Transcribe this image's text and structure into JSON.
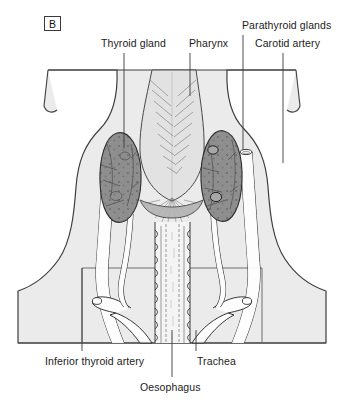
{
  "figure": {
    "panel_letter": "B",
    "caption_absent": true
  },
  "labels": {
    "thyroid_gland": "Thyroid gland",
    "pharynx": "Pharynx",
    "parathyroid_glands": "Parathyroid glands",
    "carotid_artery": "Carotid artery",
    "inferior_thyroid_artery": "Inferior thyroid artery",
    "trachea": "Trachea",
    "oesophagus": "Oesophagus"
  },
  "colors": {
    "background": "#ffffff",
    "body_fill": "#ebebeb",
    "body_outline": "#3d3d3d",
    "pharynx_fill": "#e2e2e2",
    "thyroid_fill": "#8e8e8e",
    "thyroid_outline": "#2e2e2e",
    "vessel_fill": "#fdfdfd",
    "vessel_outline": "#2b2b2b",
    "trachea_fill": "#f2f2f2",
    "leader_line": "#3a3a3a",
    "text": "#1b1b1b"
  },
  "structures": [
    {
      "name": "thyroid-gland-left-lobe",
      "kind": "gland"
    },
    {
      "name": "thyroid-gland-right-lobe",
      "kind": "gland"
    },
    {
      "name": "thyroid-isthmus",
      "kind": "gland"
    },
    {
      "name": "pharynx",
      "kind": "muscular-tube"
    },
    {
      "name": "parathyroid-gland-superior",
      "kind": "gland"
    },
    {
      "name": "parathyroid-gland-inferior",
      "kind": "gland"
    },
    {
      "name": "carotid-artery-left",
      "kind": "vessel"
    },
    {
      "name": "carotid-artery-right",
      "kind": "vessel"
    },
    {
      "name": "inferior-thyroid-artery-left",
      "kind": "vessel"
    },
    {
      "name": "inferior-thyroid-artery-right",
      "kind": "vessel"
    },
    {
      "name": "subclavian-artery-left",
      "kind": "vessel"
    },
    {
      "name": "subclavian-artery-right",
      "kind": "vessel"
    },
    {
      "name": "trachea",
      "kind": "airway"
    },
    {
      "name": "oesophagus",
      "kind": "tube"
    }
  ],
  "leaders": [
    {
      "name": "leader-thyroid-gland",
      "x1": 124,
      "y1": 53,
      "x2": 124,
      "y2": 148
    },
    {
      "name": "leader-pharynx",
      "x1": 190,
      "y1": 53,
      "x2": 190,
      "y2": 96
    },
    {
      "name": "leader-parathyroid-glands",
      "x1": 243,
      "y1": 35,
      "x2": 243,
      "y2": 150
    },
    {
      "name": "leader-carotid-artery",
      "x1": 283,
      "y1": 53,
      "x2": 283,
      "y2": 163
    },
    {
      "name": "leader-inferior-thyroid-artery",
      "x1": 82,
      "y1": 351,
      "x2": 82,
      "y2": 268
    },
    {
      "name": "leader-trachea",
      "x1": 196,
      "y1": 351,
      "x2": 196,
      "y2": 330
    },
    {
      "name": "leader-oesophagus",
      "x1": 172,
      "y1": 377,
      "x2": 172,
      "y2": 330
    }
  ]
}
